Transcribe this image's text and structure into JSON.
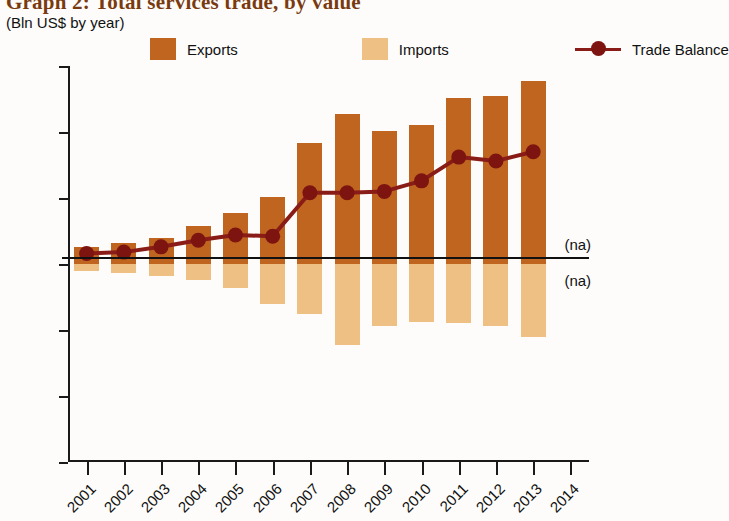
{
  "title": "Graph 2: Total services trade, by value",
  "subtitle": "(Bln US$ by year)",
  "legend": [
    {
      "label": "Exports",
      "type": "swatch",
      "color": "#bf6520",
      "icon": "square-swatch-icon"
    },
    {
      "label": "Imports",
      "type": "swatch",
      "color": "#efc084",
      "icon": "square-swatch-icon"
    },
    {
      "label": "Trade Balance",
      "type": "line-marker",
      "color": "#8a1c18",
      "icon": "line-marker-icon"
    }
  ],
  "annotations": [
    {
      "text": "(na)",
      "year": 2014,
      "position": "above-zero"
    },
    {
      "text": "(na)",
      "year": 2014,
      "position": "below-zero"
    }
  ],
  "colors": {
    "exports": "#bf6520",
    "imports": "#efc084",
    "trade_balance": "#8a1c18",
    "axis": "#1a1a1a",
    "title": "#7a3a10",
    "background": "#fdfcfa"
  },
  "chart_data": {
    "type": "bar",
    "title": "Graph 2: Total services trade, by value",
    "subtitle": "(Bln US$ by year)",
    "xlabel": "",
    "ylabel": "Bln US$ by year",
    "ylim": [
      -1.5,
      1.5
    ],
    "yticks": [
      1.5,
      1,
      0.5,
      0,
      -0.5,
      -1,
      -1.5
    ],
    "ytick_labels": [
      "1.5",
      "1",
      "0.5",
      "0",
      "-0.5",
      "-1",
      "-1.5"
    ],
    "grid": false,
    "legend_position": "top",
    "categories": [
      "2001",
      "2002",
      "2003",
      "2004",
      "2005",
      "2006",
      "2007",
      "2008",
      "2009",
      "2010",
      "2011",
      "2012",
      "2013",
      "2014"
    ],
    "series": [
      {
        "name": "Exports",
        "type": "bar",
        "color": "#bf6520",
        "values": [
          0.13,
          0.16,
          0.2,
          0.29,
          0.39,
          0.51,
          0.92,
          1.14,
          1.01,
          1.05,
          1.26,
          1.27,
          1.39,
          null
        ]
      },
      {
        "name": "Imports",
        "type": "bar",
        "color": "#efc084",
        "values": [
          -0.05,
          -0.07,
          -0.09,
          -0.12,
          -0.18,
          -0.3,
          -0.38,
          -0.61,
          -0.47,
          -0.44,
          -0.45,
          -0.47,
          -0.55,
          null
        ]
      },
      {
        "name": "Trade Balance",
        "type": "line",
        "color": "#8a1c18",
        "values": [
          0.08,
          0.09,
          0.13,
          0.18,
          0.22,
          0.21,
          0.54,
          0.54,
          0.55,
          0.63,
          0.81,
          0.78,
          0.85,
          null
        ]
      }
    ]
  }
}
